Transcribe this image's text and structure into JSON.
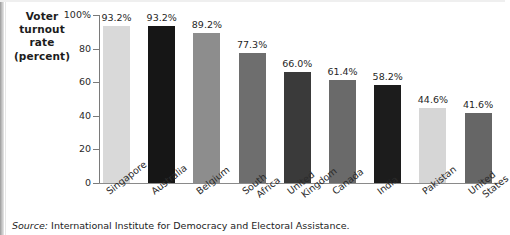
{
  "chart_data": {
    "type": "bar",
    "title": "",
    "ylabel": "Voter turnout rate (percent)",
    "xlabel": "",
    "ylim": [
      0,
      100
    ],
    "grid": false,
    "legend_position": "none",
    "ytick_labels": [
      "100%",
      "80",
      "60",
      "40",
      "20",
      "0"
    ],
    "ytick_values": [
      100,
      80,
      60,
      40,
      20,
      0
    ],
    "categories": [
      "Singapore",
      "Australia",
      "Belgium",
      "South Africa",
      "United Kingdom",
      "Canada",
      "India",
      "Pakistan",
      "United States"
    ],
    "values": [
      93.2,
      93.2,
      89.2,
      77.3,
      66.0,
      61.4,
      58.2,
      44.6,
      41.6
    ],
    "value_labels": [
      "93.2%",
      "93.2%",
      "89.2%",
      "77.3%",
      "66.0%",
      "61.4%",
      "58.2%",
      "44.6%",
      "41.6%"
    ],
    "bar_colors": [
      "#d9d9d9",
      "#161616",
      "#8d8d8d",
      "#6e6e6e",
      "#3a3a3a",
      "#6a6a6a",
      "#1c1c1c",
      "#d6d6d6",
      "#666666"
    ],
    "source": "International Institute for Democracy and Electoral Assistance."
  },
  "axis_caption": {
    "line1": "Voter",
    "line2": "turnout",
    "line3": "rate",
    "line4": "(percent)"
  },
  "footnote": {
    "label": "Source:",
    "text": "International Institute for Democracy and Electoral Assistance."
  },
  "x_label_lines": [
    [
      "Singapore"
    ],
    [
      "Australia"
    ],
    [
      "Belgium"
    ],
    [
      "South",
      "Africa"
    ],
    [
      "United",
      "Kingdom"
    ],
    [
      "Canada"
    ],
    [
      "India"
    ],
    [
      "Pakistan"
    ],
    [
      "United",
      "States"
    ]
  ],
  "colors": {
    "axis": "#7a7a7a",
    "text": "#1c1c1c",
    "background": "#ffffff"
  }
}
